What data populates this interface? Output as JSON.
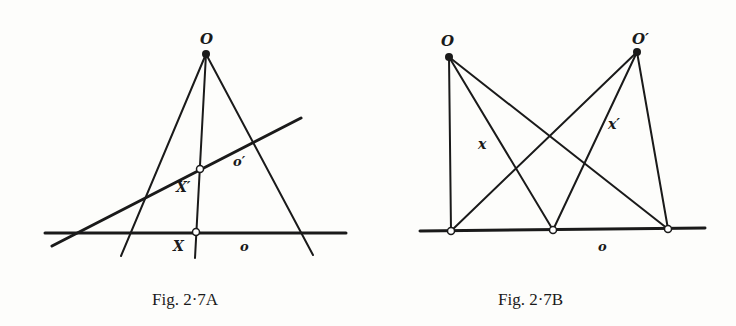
{
  "figures": [
    {
      "id": "A",
      "caption": "Fig. 2·7A",
      "labels": {
        "center": "O",
        "line_o_prime": "o′",
        "point_x_prime": "X′",
        "point_x": "X",
        "line_o": "o"
      }
    },
    {
      "id": "B",
      "caption": "Fig. 2·7B",
      "labels": {
        "center_o": "O",
        "center_o_prime": "O′",
        "ray_x": "x",
        "ray_x_prime": "x′",
        "line_o": "o"
      }
    }
  ]
}
